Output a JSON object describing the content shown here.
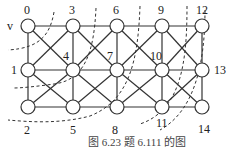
{
  "diagram": {
    "type": "grid-graph",
    "start_marker": "v",
    "nodes": [
      {
        "id": "0",
        "x": 28,
        "y": 26,
        "label_dx": 0,
        "label_dy": -12
      },
      {
        "id": "1",
        "x": 28,
        "y": 70,
        "label_dx": -14,
        "label_dy": 4
      },
      {
        "id": "2",
        "x": 28,
        "y": 107,
        "label_dx": 0,
        "label_dy": 26
      },
      {
        "id": "3",
        "x": 73,
        "y": 26,
        "label_dx": 0,
        "label_dy": -12
      },
      {
        "id": "4",
        "x": 73,
        "y": 70,
        "label_dx": -6,
        "label_dy": -10
      },
      {
        "id": "5",
        "x": 73,
        "y": 107,
        "label_dx": 0,
        "label_dy": 26
      },
      {
        "id": "6",
        "x": 117,
        "y": 26,
        "label_dx": 0,
        "label_dy": -12
      },
      {
        "id": "7",
        "x": 117,
        "y": 70,
        "label_dx": -6,
        "label_dy": -10
      },
      {
        "id": "8",
        "x": 117,
        "y": 107,
        "label_dx": -6,
        "label_dy": 26
      },
      {
        "id": "9",
        "x": 162,
        "y": 26,
        "label_dx": 0,
        "label_dy": -12
      },
      {
        "id": "10",
        "x": 162,
        "y": 70,
        "label_dx": -9,
        "label_dy": -10
      },
      {
        "id": "11",
        "x": 162,
        "y": 107,
        "label_dx": -3,
        "label_dy": 19
      },
      {
        "id": "12",
        "x": 202,
        "y": 26,
        "label_dx": 2,
        "label_dy": -12
      },
      {
        "id": "13",
        "x": 202,
        "y": 70,
        "label_dx": 20,
        "label_dy": 4
      },
      {
        "id": "14",
        "x": 202,
        "y": 107,
        "label_dx": 6,
        "label_dy": 26
      }
    ],
    "caption": "图 6.23   题 6.111 的图"
  }
}
